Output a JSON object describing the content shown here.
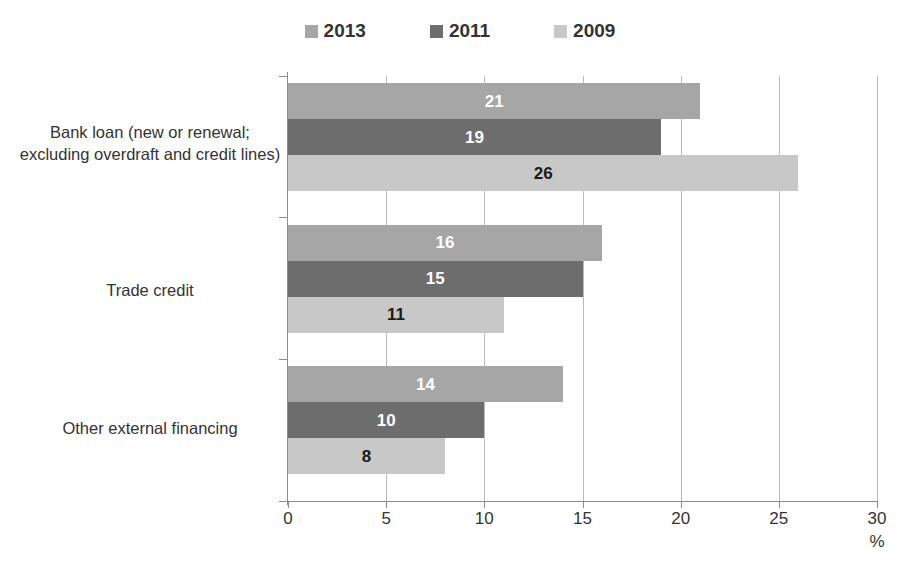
{
  "legend": {
    "items": [
      {
        "label": "2013",
        "color": "#a6a6a6"
      },
      {
        "label": "2011",
        "color": "#6d6d6d"
      },
      {
        "label": "2009",
        "color": "#c8c8c8"
      }
    ]
  },
  "axis": {
    "unit": "%",
    "ticks": [
      "0",
      "5",
      "10",
      "15",
      "20",
      "25",
      "30"
    ]
  },
  "categories": [
    "Bank loan (new or renewal; excluding overdraft and credit lines)",
    "Trade credit",
    "Other external financing"
  ],
  "chart_data": {
    "type": "bar",
    "orientation": "horizontal",
    "title": "",
    "xlabel": "%",
    "ylabel": "",
    "xlim": [
      0,
      30
    ],
    "xticks": [
      0,
      5,
      10,
      15,
      20,
      25,
      30
    ],
    "grid": true,
    "legend_position": "top-center",
    "categories": [
      "Bank loan (new or renewal; excluding overdraft and credit lines)",
      "Trade credit",
      "Other external financing"
    ],
    "series": [
      {
        "name": "2013",
        "color": "#a6a6a6",
        "label_color": "#ffffff",
        "values": [
          21,
          16,
          14
        ]
      },
      {
        "name": "2011",
        "color": "#6d6d6d",
        "label_color": "#ffffff",
        "values": [
          19,
          15,
          10
        ]
      },
      {
        "name": "2009",
        "color": "#c8c8c8",
        "label_color": "#1a1a1a",
        "values": [
          26,
          11,
          8
        ]
      }
    ]
  }
}
